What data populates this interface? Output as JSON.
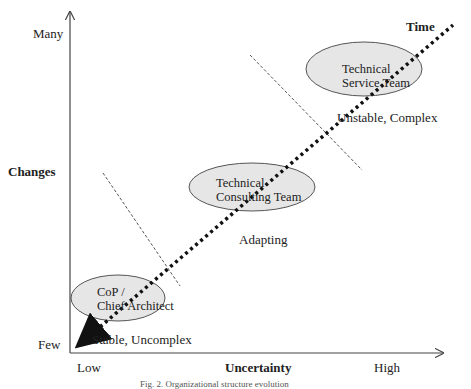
{
  "diagram": {
    "y_axis": {
      "label": "Changes",
      "top_label": "Many",
      "bottom_label": "Few"
    },
    "x_axis": {
      "label": "Uncertainty",
      "left_label": "Low",
      "right_label": "High"
    },
    "diagonal_label": "Time",
    "zones": [
      {
        "ellipse_line1": "CoP /",
        "ellipse_line2": "Chief Architect",
        "state": "Stable, Uncomplex"
      },
      {
        "ellipse_line1": "Technical",
        "ellipse_line2": "Consulting Team",
        "state": "Adapting"
      },
      {
        "ellipse_line1": "Technical",
        "ellipse_line2": "Service Team",
        "state": "Unstable, Complex"
      }
    ],
    "caption": "Fig. 2. Organizational structure evolution",
    "colors": {
      "ellipse_fill": "#e6e6e6",
      "ellipse_stroke": "#555555",
      "axis": "#444444",
      "dots": "#111111"
    }
  }
}
